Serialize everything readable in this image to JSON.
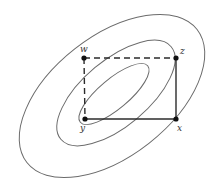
{
  "diagram": {
    "contours": [
      {
        "name": "outer",
        "cx": 112,
        "cy": 96,
        "rx": 108,
        "ry": 60,
        "rotate": -38
      },
      {
        "name": "middle",
        "cx": 114,
        "cy": 94,
        "rx": 72,
        "ry": 33,
        "rotate": -40
      },
      {
        "name": "inner",
        "cx": 114,
        "cy": 94,
        "rx": 42,
        "ry": 16,
        "rotate": -40
      }
    ],
    "points": [
      {
        "id": "w",
        "label": "w",
        "x": 84,
        "y": 58
      },
      {
        "id": "z",
        "label": "z",
        "x": 176,
        "y": 58
      },
      {
        "id": "y",
        "label": "y",
        "x": 85,
        "y": 119
      },
      {
        "id": "x",
        "label": "x",
        "x": 176,
        "y": 119
      }
    ],
    "edges": [
      {
        "from": "w",
        "to": "z",
        "style": "dashed"
      },
      {
        "from": "w",
        "to": "y",
        "style": "dashed"
      },
      {
        "from": "z",
        "to": "x",
        "style": "solid"
      },
      {
        "from": "y",
        "to": "x",
        "style": "solid"
      }
    ],
    "labels": {
      "w": "w",
      "z": "z",
      "y": "y",
      "x": "x"
    },
    "colors": {
      "contour": "#6b6b6b",
      "edge": "#2b2b2b",
      "point": "#111111",
      "background": "#ffffff"
    }
  }
}
